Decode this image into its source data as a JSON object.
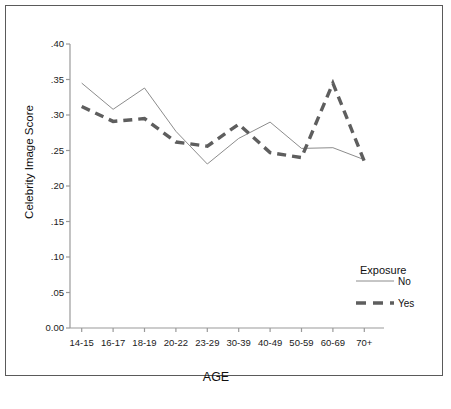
{
  "chart_data": {
    "type": "line",
    "title": "",
    "xlabel": "AGE",
    "ylabel": "Celebrity Image Score",
    "categories": [
      "14-15",
      "16-17",
      "18-19",
      "20-22",
      "23-29",
      "30-39",
      "40-49",
      "50-59",
      "60-69",
      "70+"
    ],
    "ylim": [
      0.0,
      0.4
    ],
    "yticks": [
      0.4,
      0.35,
      0.3,
      0.25,
      0.2,
      0.15,
      0.1,
      0.05,
      0.0
    ],
    "ytick_labels": [
      ".40",
      ".35",
      ".30",
      ".25",
      ".20",
      ".15",
      ".10",
      ".05",
      "0.00"
    ],
    "grid": false,
    "legend_position": "right",
    "legend_title": "Exposure",
    "series": [
      {
        "name": "No",
        "style": "solid-thin",
        "color": "#8c8c8c",
        "values": [
          0.345,
          0.308,
          0.338,
          0.277,
          0.231,
          0.267,
          0.29,
          0.253,
          0.254,
          0.237
        ]
      },
      {
        "name": "Yes",
        "style": "dashed-thick",
        "color": "#5e5e5e",
        "values": [
          0.312,
          0.291,
          0.295,
          0.262,
          0.256,
          0.287,
          0.247,
          0.24,
          0.345,
          0.235
        ]
      }
    ]
  },
  "legend": {
    "title": "Exposure",
    "entries": [
      {
        "label": "No",
        "swatch": "solid-thin-line-swatch"
      },
      {
        "label": "Yes",
        "swatch": "dashed-thick-line-swatch"
      }
    ]
  },
  "colors": {
    "frame": "#5a5a5a",
    "axis": "#9a9a9a",
    "series_no": "#8c8c8c",
    "series_yes": "#5e5e5e",
    "text": "#111111",
    "background": "#ffffff"
  }
}
